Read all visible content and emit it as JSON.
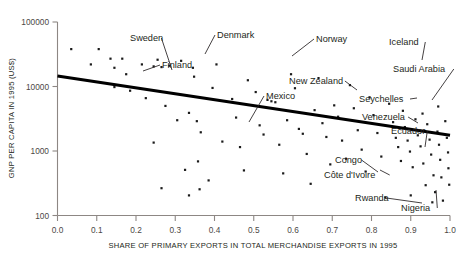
{
  "chart_data": {
    "type": "scatter",
    "title": "",
    "xlabel": "SHARE OF PRIMARY EXPORTS IN TOTAL MERCHANDISE EXPORTS IN 1995",
    "ylabel": "GNP PER CAPITA IN 1995 (US$)",
    "xlim": [
      0.0,
      1.0
    ],
    "ylim": [
      100,
      100000
    ],
    "yscale": "log",
    "xscale": "linear",
    "grid": false,
    "legend": false,
    "xticks": [
      "0.0",
      "0.1",
      "0.2",
      "0.3",
      "0.4",
      "0.5",
      "0.6",
      "0.7",
      "0.8",
      "0.9",
      "1.0"
    ],
    "xtick_values": [
      0.0,
      0.1,
      0.2,
      0.3,
      0.4,
      0.5,
      0.6,
      0.7,
      0.8,
      0.9,
      1.0
    ],
    "yticks": [
      "100",
      "1000",
      "10000",
      "100000"
    ],
    "ytick_values": [
      100,
      1000,
      10000,
      100000
    ],
    "trendline": {
      "type": "linear-on-log-y",
      "x_start": 0.0,
      "y_start": 14500,
      "x_end": 1.0,
      "y_end": 1750
    },
    "points": [
      {
        "x": 0.035,
        "y": 38000
      },
      {
        "x": 0.085,
        "y": 22000
      },
      {
        "x": 0.105,
        "y": 38000
      },
      {
        "x": 0.135,
        "y": 27000
      },
      {
        "x": 0.165,
        "y": 27000
      },
      {
        "x": 0.145,
        "y": 19500
      },
      {
        "x": 0.175,
        "y": 15500
      },
      {
        "x": 0.145,
        "y": 9800
      },
      {
        "x": 0.185,
        "y": 8600
      },
      {
        "x": 0.215,
        "y": 22000
      },
      {
        "x": 0.245,
        "y": 20500
      },
      {
        "x": 0.255,
        "y": 26000
      },
      {
        "x": 0.265,
        "y": 20000
      },
      {
        "x": 0.285,
        "y": 21000
      },
      {
        "x": 0.225,
        "y": 6600
      },
      {
        "x": 0.275,
        "y": 5000
      },
      {
        "x": 0.245,
        "y": 1350
      },
      {
        "x": 0.305,
        "y": 3000
      },
      {
        "x": 0.265,
        "y": 265
      },
      {
        "x": 0.335,
        "y": 3900
      },
      {
        "x": 0.325,
        "y": 510
      },
      {
        "x": 0.335,
        "y": 205
      },
      {
        "x": 0.355,
        "y": 2900
      },
      {
        "x": 0.365,
        "y": 1950
      },
      {
        "x": 0.358,
        "y": 690
      },
      {
        "x": 0.362,
        "y": 255
      },
      {
        "x": 0.315,
        "y": 25000
      },
      {
        "x": 0.345,
        "y": 19500
      },
      {
        "x": 0.348,
        "y": 14200
      },
      {
        "x": 0.385,
        "y": 350
      },
      {
        "x": 0.42,
        "y": 1400
      },
      {
        "x": 0.405,
        "y": 22000
      },
      {
        "x": 0.395,
        "y": 9500
      },
      {
        "x": 0.445,
        "y": 6400
      },
      {
        "x": 0.455,
        "y": 3300
      },
      {
        "x": 0.465,
        "y": 1150
      },
      {
        "x": 0.475,
        "y": 500
      },
      {
        "x": 0.485,
        "y": 12500
      },
      {
        "x": 0.505,
        "y": 8200
      },
      {
        "x": 0.515,
        "y": 2500
      },
      {
        "x": 0.525,
        "y": 1800
      },
      {
        "x": 0.535,
        "y": 6200
      },
      {
        "x": 0.545,
        "y": 5900
      },
      {
        "x": 0.555,
        "y": 5700
      },
      {
        "x": 0.565,
        "y": 1250
      },
      {
        "x": 0.575,
        "y": 450
      },
      {
        "x": 0.585,
        "y": 3000
      },
      {
        "x": 0.595,
        "y": 15500
      },
      {
        "x": 0.605,
        "y": 9400
      },
      {
        "x": 0.615,
        "y": 2200
      },
      {
        "x": 0.625,
        "y": 1850
      },
      {
        "x": 0.635,
        "y": 900
      },
      {
        "x": 0.645,
        "y": 310
      },
      {
        "x": 0.655,
        "y": 4300
      },
      {
        "x": 0.665,
        "y": 13500
      },
      {
        "x": 0.675,
        "y": 2700
      },
      {
        "x": 0.685,
        "y": 1650
      },
      {
        "x": 0.695,
        "y": 620
      },
      {
        "x": 0.705,
        "y": 5100
      },
      {
        "x": 0.715,
        "y": 3400
      },
      {
        "x": 0.725,
        "y": 1450
      },
      {
        "x": 0.735,
        "y": 760
      },
      {
        "x": 0.745,
        "y": 10500
      },
      {
        "x": 0.755,
        "y": 4600
      },
      {
        "x": 0.765,
        "y": 2100
      },
      {
        "x": 0.775,
        "y": 1050
      },
      {
        "x": 0.785,
        "y": 480
      },
      {
        "x": 0.795,
        "y": 6800
      },
      {
        "x": 0.805,
        "y": 3600
      },
      {
        "x": 0.815,
        "y": 1900
      },
      {
        "x": 0.825,
        "y": 820
      },
      {
        "x": 0.835,
        "y": 190
      },
      {
        "x": 0.845,
        "y": 5400
      },
      {
        "x": 0.855,
        "y": 2800
      },
      {
        "x": 0.862,
        "y": 1600
      },
      {
        "x": 0.868,
        "y": 1150
      },
      {
        "x": 0.875,
        "y": 700
      },
      {
        "x": 0.885,
        "y": 2350
      },
      {
        "x": 0.892,
        "y": 1450
      },
      {
        "x": 0.898,
        "y": 980
      },
      {
        "x": 0.905,
        "y": 560
      },
      {
        "x": 0.912,
        "y": 3100
      },
      {
        "x": 0.918,
        "y": 1750
      },
      {
        "x": 0.925,
        "y": 1180
      },
      {
        "x": 0.932,
        "y": 640
      },
      {
        "x": 0.938,
        "y": 295
      },
      {
        "x": 0.942,
        "y": 2600
      },
      {
        "x": 0.948,
        "y": 1500
      },
      {
        "x": 0.952,
        "y": 880
      },
      {
        "x": 0.958,
        "y": 420
      },
      {
        "x": 0.962,
        "y": 230
      },
      {
        "x": 0.968,
        "y": 2000
      },
      {
        "x": 0.972,
        "y": 1250
      },
      {
        "x": 0.975,
        "y": 730
      },
      {
        "x": 0.978,
        "y": 390
      },
      {
        "x": 0.982,
        "y": 170
      },
      {
        "x": 0.988,
        "y": 2900
      },
      {
        "x": 0.992,
        "y": 1600
      },
      {
        "x": 0.995,
        "y": 950
      },
      {
        "x": 0.996,
        "y": 540
      },
      {
        "x": 0.998,
        "y": 300
      },
      {
        "x": 0.88,
        "y": 4200
      },
      {
        "x": 0.93,
        "y": 3800
      },
      {
        "x": 0.97,
        "y": 4900
      },
      {
        "x": 0.9,
        "y": 205
      },
      {
        "x": 0.955,
        "y": 160
      }
    ],
    "annotations": [
      {
        "label": "Sweden",
        "lx": 130,
        "ly": 41,
        "px": 172,
        "py": 70
      },
      {
        "label": "Finland",
        "lx": 162,
        "ly": 68,
        "px": 143,
        "py": 71
      },
      {
        "label": "Denmark",
        "lx": 217,
        "ly": 38,
        "px": 205,
        "py": 54
      },
      {
        "label": "Norway",
        "lx": 316,
        "ly": 42,
        "px": 292,
        "py": 56
      },
      {
        "label": "Iceland",
        "lx": 389,
        "ly": 45,
        "px": 422,
        "py": 60
      },
      {
        "label": "Saudi Arabia",
        "lx": 393,
        "ly": 72,
        "px": 432,
        "py": 100
      },
      {
        "label": "New Zealand",
        "lx": 289,
        "ly": 84,
        "px": 357,
        "py": 90
      },
      {
        "label": "Mexico",
        "lx": 266,
        "ly": 99,
        "px": 249,
        "py": 122
      },
      {
        "label": "Seychelles",
        "lx": 359,
        "ly": 102,
        "px": 417,
        "py": 98
      },
      {
        "label": "Venezuela",
        "lx": 362,
        "ly": 120,
        "px": 418,
        "py": 123
      },
      {
        "label": "Ecuador",
        "lx": 391,
        "ly": 134,
        "px": 425,
        "py": 147
      },
      {
        "label": "Congo",
        "lx": 335,
        "ly": 163,
        "px": 378,
        "py": 172
      },
      {
        "label": "Côte d'Ivoire",
        "lx": 324,
        "ly": 178,
        "px": 380,
        "py": 170
      },
      {
        "label": "Rwanda",
        "lx": 355,
        "ly": 201,
        "px": 422,
        "py": 203
      },
      {
        "label": "Nigeria",
        "lx": 401,
        "ly": 211,
        "px": 436,
        "py": 190
      }
    ]
  },
  "axes": {
    "y_title": "GNP PER CAPITA IN 1995 (US$)",
    "x_title": "SHARE OF PRIMARY EXPORTS IN TOTAL MERCHANDISE EXPORTS IN 1995"
  }
}
